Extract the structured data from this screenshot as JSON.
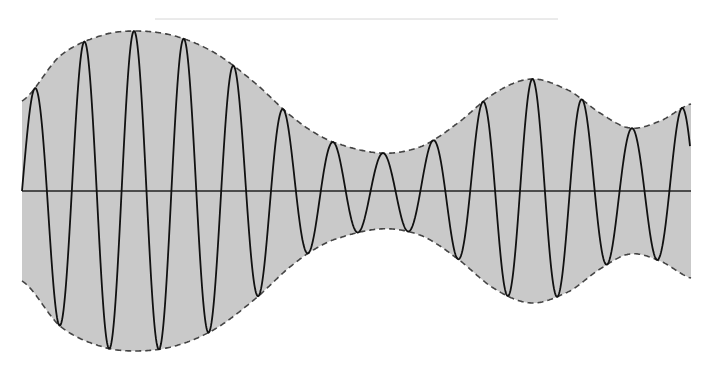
{
  "figure": {
    "type": "amplitude-modulated-waveform",
    "width": 717,
    "height": 375,
    "top_rule": {
      "x1": 155,
      "x2": 558,
      "y": 19,
      "color": "#d6d6d6"
    },
    "axis": {
      "x1": 22,
      "x2": 691,
      "y": 191,
      "color": "#222222"
    },
    "colors": {
      "fill": "#c9c9c9",
      "envelope": "#444444",
      "carrier": "#111111",
      "background": "#ffffff"
    },
    "carrier": {
      "x_start": 22,
      "x_end": 690,
      "period": 49.8,
      "phase_start": "rising"
    },
    "envelope_points": [
      {
        "x": 22,
        "amp": 90
      },
      {
        "x": 60,
        "amp": 135
      },
      {
        "x": 100,
        "amp": 155
      },
      {
        "x": 135,
        "amp": 160
      },
      {
        "x": 175,
        "amp": 155
      },
      {
        "x": 215,
        "amp": 138
      },
      {
        "x": 255,
        "amp": 108
      },
      {
        "x": 295,
        "amp": 72
      },
      {
        "x": 330,
        "amp": 50
      },
      {
        "x": 380,
        "amp": 38
      },
      {
        "x": 420,
        "amp": 44
      },
      {
        "x": 455,
        "amp": 66
      },
      {
        "x": 495,
        "amp": 98
      },
      {
        "x": 532,
        "amp": 112
      },
      {
        "x": 570,
        "amp": 100
      },
      {
        "x": 600,
        "amp": 78
      },
      {
        "x": 630,
        "amp": 63
      },
      {
        "x": 660,
        "amp": 70
      },
      {
        "x": 691,
        "amp": 87
      }
    ]
  }
}
